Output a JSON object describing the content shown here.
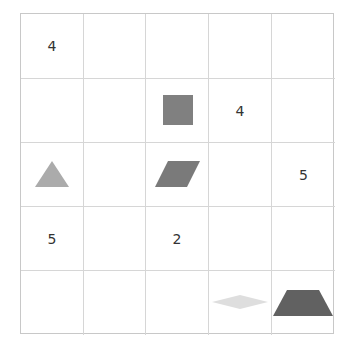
{
  "board": {
    "rows": 5,
    "cols": 5,
    "cells": [
      [
        "4",
        "",
        "",
        "",
        ""
      ],
      [
        "",
        "",
        "",
        "4",
        ""
      ],
      [
        "",
        "",
        "",
        "",
        "5"
      ],
      [
        "5",
        "",
        "2",
        "",
        ""
      ],
      [
        "",
        "",
        "",
        "",
        ""
      ]
    ],
    "shapes": [
      {
        "row": 1,
        "col": 2,
        "type": "square",
        "color": "#808080"
      },
      {
        "row": 2,
        "col": 0,
        "type": "triangle",
        "color": "#ababab"
      },
      {
        "row": 2,
        "col": 2,
        "type": "parallelogram",
        "color": "#7a7a7a"
      },
      {
        "row": 4,
        "col": 3,
        "type": "diamond",
        "color": "#dedede"
      },
      {
        "row": 4,
        "col": 4,
        "type": "trapezoid",
        "color": "#616161"
      }
    ]
  }
}
